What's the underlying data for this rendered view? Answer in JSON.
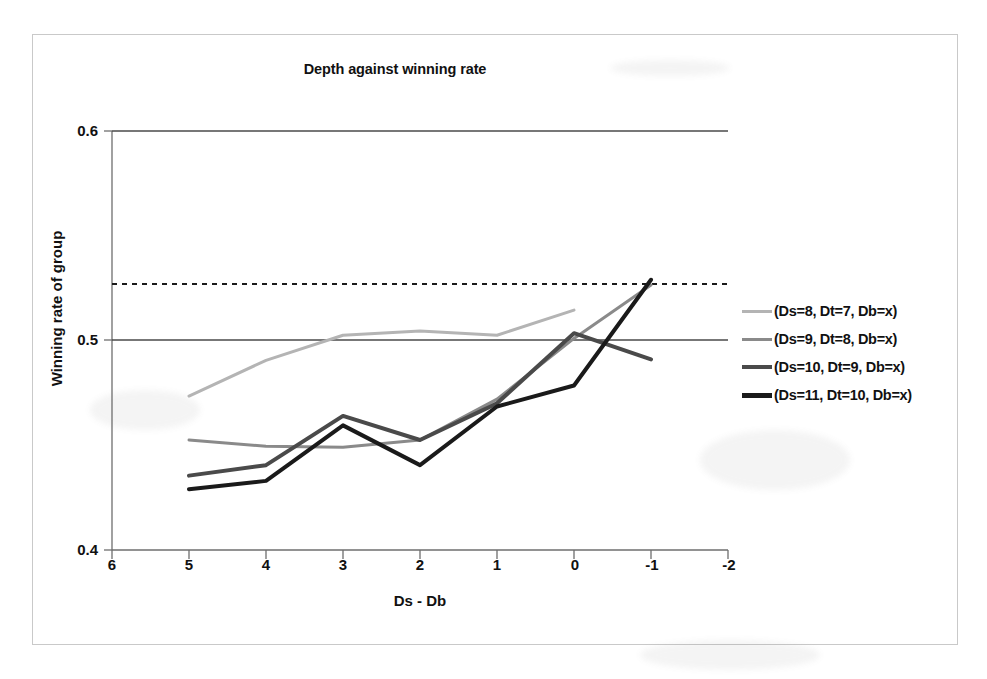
{
  "chart_data": {
    "type": "line",
    "title": "Depth against winning rate",
    "xlabel": "Ds - Db",
    "ylabel": "Winning rate of group",
    "xlim": [
      6,
      -2
    ],
    "ylim": [
      0.4,
      0.6
    ],
    "x_ticks": [
      "6",
      "5",
      "4",
      "3",
      "2",
      "1",
      "0",
      "-1",
      "-2"
    ],
    "y_ticks": [
      "0.4",
      "0.5",
      "0.6"
    ],
    "x_axis_inverted": true,
    "grid": false,
    "gridlines": [
      {
        "value": 0.5,
        "style": "solid",
        "color": "#4a4a4a"
      },
      {
        "value": 0.6,
        "style": "solid",
        "color": "#4a4a4a"
      }
    ],
    "reference_line": {
      "value": 0.527,
      "style": "dashed",
      "color": "#1a1a1a"
    },
    "legend_position": "right",
    "x": [
      5,
      4,
      3,
      2,
      1,
      0,
      -1
    ],
    "series": [
      {
        "name": "(Ds=8, Dt=7, Db=x)",
        "color": "#b4b4b4",
        "width": 3,
        "x": [
          5,
          4,
          3,
          2,
          1,
          0
        ],
        "values": [
          0.4735,
          0.4905,
          0.5025,
          0.5045,
          0.5025,
          0.5145
        ]
      },
      {
        "name": "(Ds=9, Dt=8, Db=x)",
        "color": "#8a8a8a",
        "width": 3,
        "x": [
          5,
          4,
          3,
          2,
          1,
          0,
          -1
        ],
        "values": [
          0.4525,
          0.4495,
          0.449,
          0.4525,
          0.472,
          0.501,
          0.5265
        ]
      },
      {
        "name": "(Ds=10, Dt=9, Db=x)",
        "color": "#4a4a4a",
        "width": 4,
        "x": [
          5,
          4,
          3,
          2,
          1,
          0,
          -1
        ],
        "values": [
          0.4355,
          0.4405,
          0.464,
          0.4525,
          0.47,
          0.5035,
          0.491
        ]
      },
      {
        "name": "(Ds=11, Dt=10, Db=x)",
        "color": "#1a1a1a",
        "width": 4,
        "x": [
          5,
          4,
          3,
          2,
          1,
          0,
          -1
        ],
        "values": [
          0.429,
          0.433,
          0.4595,
          0.4405,
          0.4685,
          0.4785,
          0.529
        ]
      }
    ]
  },
  "legend": {
    "items": [
      {
        "label": "(Ds=8, Dt=7, Db=x)",
        "color": "#b4b4b4",
        "width": 3
      },
      {
        "label": "(Ds=9, Dt=8, Db=x)",
        "color": "#8a8a8a",
        "width": 3
      },
      {
        "label": "(Ds=10, Dt=9, Db=x)",
        "color": "#4a4a4a",
        "width": 4
      },
      {
        "label": "(Ds=11, Dt=10, Db=x)",
        "color": "#1a1a1a",
        "width": 5
      }
    ]
  }
}
